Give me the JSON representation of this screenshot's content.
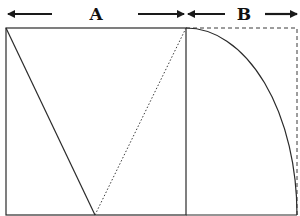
{
  "diagram": {
    "type": "golden-rectangle-construction",
    "colors": {
      "stroke": "#2a2a2a",
      "background": "#ffffff"
    },
    "labels": {
      "a": "A",
      "b": "B"
    },
    "dimensions": {
      "a": {
        "label": "A",
        "from_x": 6,
        "to_x": 186,
        "arrow_y": 14
      },
      "b": {
        "label": "B",
        "from_x": 186,
        "to_x": 297,
        "arrow_y": 14
      }
    },
    "shapes": {
      "square": {
        "x": 6,
        "y": 28,
        "width": 180,
        "height": 187,
        "style": "solid"
      },
      "extension_rect": {
        "x": 186,
        "y": 28,
        "width": 111,
        "height": 187,
        "style": "dashed"
      },
      "solid_diagonal": {
        "from": [
          6,
          28
        ],
        "to": [
          95,
          215
        ],
        "style": "solid"
      },
      "dotted_diagonal": {
        "from": [
          95,
          215
        ],
        "to": [
          186,
          28
        ],
        "style": "dotted"
      },
      "arc": {
        "center": [
          186,
          215
        ],
        "start": [
          186,
          28
        ],
        "end": [
          297,
          215
        ],
        "style": "solid"
      }
    }
  }
}
